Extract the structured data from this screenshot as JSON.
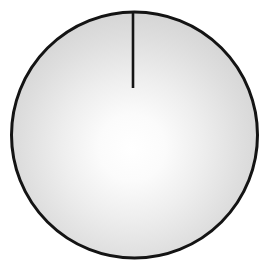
{
  "figure": {
    "name": "shaded-sphere-with-radius",
    "background_color": "#ffffff",
    "canvas": {
      "width": 271,
      "height": 273
    }
  },
  "sphere": {
    "label": "sphere",
    "center": {
      "cx": 134.5,
      "cy": 135.0
    },
    "radius": 123.0,
    "bounds": {
      "left": 11.5,
      "right": 257.5,
      "top": 12.0,
      "bottom": 258.0
    },
    "outline_color": "#141414",
    "outline_width": 3.0,
    "fill_gradient": {
      "type": "radial",
      "highlight_center": {
        "x": 132,
        "y": 148
      },
      "highlight_color": "#ffffff",
      "mid_color": "#e2e2e2",
      "edge_color": "#c6c6c6",
      "stops": [
        {
          "offset": "0%",
          "color": "#ffffff"
        },
        {
          "offset": "18%",
          "color": "#fbfbfb"
        },
        {
          "offset": "38%",
          "color": "#eeeeee"
        },
        {
          "offset": "60%",
          "color": "#dedede"
        },
        {
          "offset": "80%",
          "color": "#d1d1d1"
        },
        {
          "offset": "100%",
          "color": "#c6c6c6"
        }
      ]
    }
  },
  "radius_line": {
    "label": "radius-line",
    "orientation": "vertical",
    "x": 133.0,
    "y_start": 12.0,
    "y_end": 88.0,
    "length": 76.0,
    "stroke_color": "#141414",
    "stroke_width": 2.6,
    "starts_at": "top-of-circle",
    "ends_at": "interior-point-above-center"
  },
  "chart_data": {
    "type": "diagram",
    "title": "",
    "shapes": [
      {
        "kind": "circle",
        "name": "sphere-outline",
        "cx": 134.5,
        "cy": 135.0,
        "r": 123.0,
        "stroke": "#141414",
        "stroke_width": 3.0,
        "fill": "radial-gradient-white-to-gray"
      },
      {
        "kind": "line",
        "name": "radius-line",
        "x1": 133.0,
        "y1": 12.0,
        "x2": 133.0,
        "y2": 88.0,
        "stroke": "#141414",
        "stroke_width": 2.6
      }
    ],
    "annotations": [],
    "legend": []
  }
}
